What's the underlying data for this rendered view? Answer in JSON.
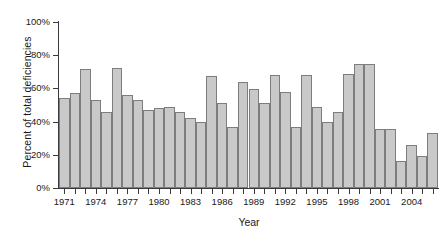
{
  "chart_data": {
    "type": "bar",
    "title": "",
    "xlabel": "Year",
    "ylabel": "Percent of total deficiencies",
    "ylim": [
      0,
      100
    ],
    "ytick_labels": [
      "0%",
      "20%",
      "40%",
      "60%",
      "80%",
      "100%"
    ],
    "ytick_values": [
      0,
      20,
      40,
      60,
      80,
      100
    ],
    "xtick_labels": [
      "1971",
      "1974",
      "1977",
      "1980",
      "1983",
      "1986",
      "1989",
      "1992",
      "1995",
      "1998",
      "2001",
      "2004"
    ],
    "grid": false,
    "legend": null,
    "bar_color": "#c9c9c9",
    "bar_edge_color": "#7d7d7d",
    "categories": [
      "1971",
      "1972",
      "1973",
      "1974",
      "1975",
      "1976",
      "1977",
      "1978",
      "1979",
      "1980",
      "1981",
      "1982",
      "1983",
      "1984",
      "1985",
      "1986",
      "1987",
      "1988",
      "1989",
      "1990",
      "1991",
      "1992",
      "1993",
      "1994",
      "1995",
      "1996",
      "1997",
      "1998",
      "1999",
      "2000",
      "2001",
      "2002",
      "2003",
      "2004",
      "2005",
      "2006"
    ],
    "values": [
      54,
      57.5,
      71.5,
      53,
      46,
      72.5,
      56,
      53,
      47,
      48.5,
      49,
      45.5,
      42,
      40,
      67.5,
      51,
      37,
      64,
      59.5,
      51,
      68,
      58,
      37,
      68,
      49,
      39.5,
      46,
      68.5,
      75,
      75,
      35.5,
      35.5,
      16.5,
      26,
      19,
      33
    ]
  }
}
